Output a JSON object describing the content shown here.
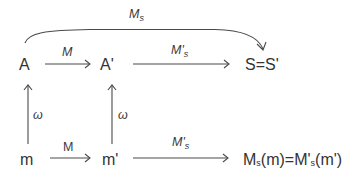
{
  "diagram": {
    "nodes": {
      "A": "A",
      "A_prime": "A'",
      "S": "S=S'",
      "m": "m",
      "m_prime": "m'",
      "result": {
        "main1": "M",
        "sub1": "s",
        "rest1": "(m)=M'",
        "sub2": "s",
        "rest2": "(m')"
      }
    },
    "edges": {
      "top_curve": {
        "label_main": "M",
        "label_sub": "s"
      },
      "A_to_Aprime": {
        "label": "M"
      },
      "Aprime_to_S": {
        "label_main": "M'",
        "label_sub": "s"
      },
      "m_to_A": {
        "label": "ω"
      },
      "mprime_to_Aprime": {
        "label": "ω"
      },
      "m_to_mprime": {
        "label": "M"
      },
      "mprime_to_result": {
        "label_main": "M'",
        "label_sub": "s"
      }
    }
  }
}
